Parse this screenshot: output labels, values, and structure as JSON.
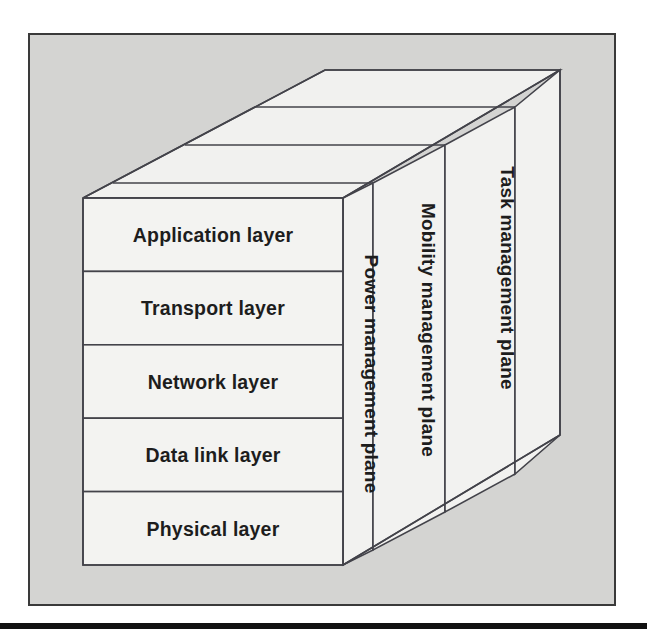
{
  "figure": {
    "background_color": "#d4d4d2",
    "panel_color": "#f3f3f1",
    "line_color": "#43434a",
    "text_color": "#1d1d1d"
  },
  "layers": [
    {
      "id": "application",
      "label": "Application layer"
    },
    {
      "id": "transport",
      "label": "Transport layer"
    },
    {
      "id": "network",
      "label": "Network layer"
    },
    {
      "id": "datalink",
      "label": "Data link layer"
    },
    {
      "id": "physical",
      "label": "Physical layer"
    }
  ],
  "planes": [
    {
      "id": "power",
      "label": "Power management plane"
    },
    {
      "id": "mobility",
      "label": "Mobility management plane"
    },
    {
      "id": "task",
      "label": "Task management plane"
    }
  ],
  "footer": {
    "rule_label": "horizontal-rule"
  }
}
